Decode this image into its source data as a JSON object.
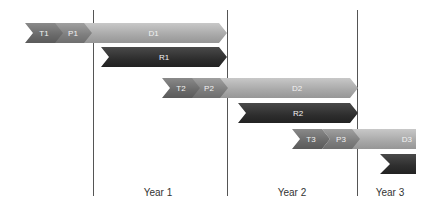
{
  "diagram": {
    "rows": [
      {
        "phases": [
          {
            "label": "T1"
          },
          {
            "label": "P1"
          },
          {
            "label": "D1"
          }
        ],
        "result": {
          "label": "R1"
        }
      },
      {
        "phases": [
          {
            "label": "T2"
          },
          {
            "label": "P2"
          },
          {
            "label": "D2"
          }
        ],
        "result": {
          "label": "R2"
        }
      },
      {
        "phases": [
          {
            "label": "T3"
          },
          {
            "label": "P3"
          },
          {
            "label": "D3"
          }
        ],
        "result": {
          "label": ""
        }
      }
    ],
    "years": [
      {
        "label": "Year 1"
      },
      {
        "label": "Year 2"
      },
      {
        "label": "Year 3"
      }
    ],
    "colors": {
      "T": "#6a6a6a",
      "P": "#7e7e7e",
      "D": "#a8a8a8",
      "R": "#2e2e2e",
      "grid": "#555555"
    }
  }
}
